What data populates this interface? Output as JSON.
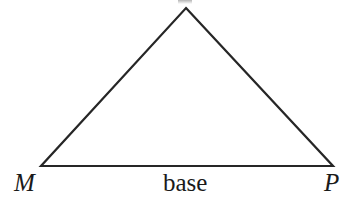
{
  "figure": {
    "type": "geometry-diagram",
    "shape": "triangle",
    "background_color": "#ffffff",
    "stroke_color": "#262626",
    "stroke_width": 2.2,
    "width": 359,
    "height": 212
  },
  "geometry": {
    "apex": {
      "x": 186,
      "y": 8
    },
    "left_vertex": {
      "x": 41,
      "y": 166
    },
    "right_vertex": {
      "x": 333,
      "y": 166
    }
  },
  "labels": {
    "apex_label": "",
    "left_vertex_label": "M",
    "right_vertex_label": "P",
    "base_label": "base"
  }
}
